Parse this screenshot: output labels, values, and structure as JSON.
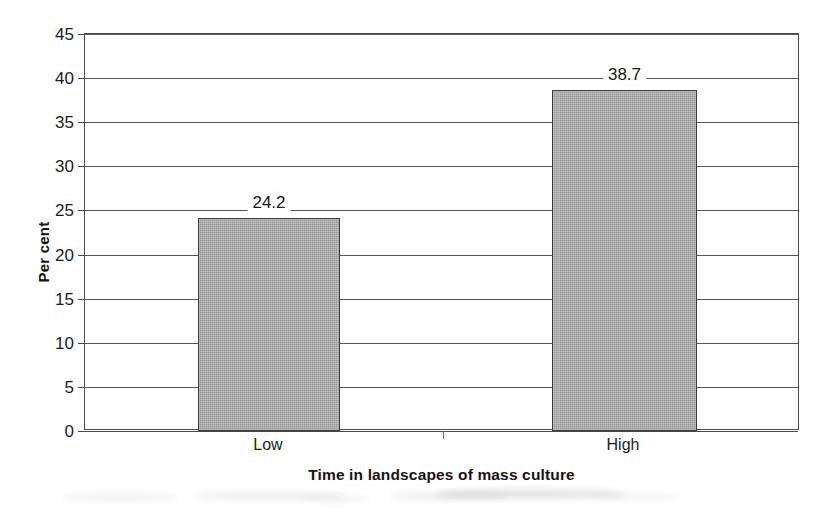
{
  "chart_data": {
    "type": "bar",
    "title": "",
    "categories": [
      "Low",
      "High"
    ],
    "values": [
      24.2,
      38.7
    ],
    "value_labels": [
      "24.2",
      "38.7"
    ],
    "xlabel": "Time in landscapes of mass culture",
    "ylabel": "Per cent",
    "ylim": [
      0,
      45
    ],
    "ytick_step": 5,
    "ytick_labels": [
      "0",
      "5",
      "10",
      "15",
      "20",
      "25",
      "30",
      "35",
      "40",
      "45"
    ],
    "ytick_values": [
      0,
      5,
      10,
      15,
      20,
      25,
      30,
      35,
      40,
      45
    ],
    "grid": "horizontal",
    "legend": "none",
    "bar_fill_color": "#a9a9a9",
    "bar_border_color": "#3c3c3c",
    "axis_color": "#4a4a4a",
    "gridline_color": "#585858",
    "text_color": "#1a1a1a",
    "background_color": "#ffffff"
  }
}
